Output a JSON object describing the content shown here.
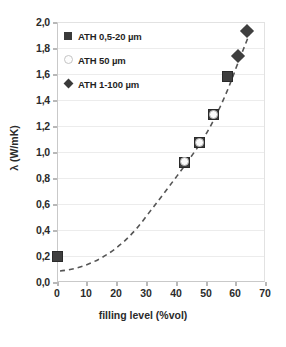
{
  "chart_data": {
    "type": "scatter",
    "title": "",
    "xlabel": "filling level (%vol)",
    "ylabel": "λ (W/mK)",
    "xlim": [
      0,
      70
    ],
    "ylim": [
      0.0,
      2.0
    ],
    "xticks": [
      "0",
      "10",
      "20",
      "30",
      "40",
      "50",
      "60",
      "70"
    ],
    "yticks": [
      "0,0",
      "0,2",
      "0,4",
      "0,6",
      "0,8",
      "1,0",
      "1,2",
      "1,4",
      "1,6",
      "1,8",
      "2,0"
    ],
    "grid": "horizontal",
    "legend_position": "upper-left-inside",
    "trendline": "dashed",
    "series": [
      {
        "name": "ATH 0,5-20 µm",
        "marker": "filled-square",
        "color": "#3f3f3f",
        "points": [
          {
            "x": 0,
            "y": 0.2
          },
          {
            "x": 43,
            "y": 0.92
          },
          {
            "x": 48,
            "y": 1.07
          },
          {
            "x": 52.5,
            "y": 1.29
          },
          {
            "x": 57.5,
            "y": 1.58
          }
        ]
      },
      {
        "name": "ATH 50 µm",
        "marker": "open-circle",
        "color": "#fbfbfb",
        "points": [
          {
            "x": 43,
            "y": 0.93
          },
          {
            "x": 48,
            "y": 1.07
          },
          {
            "x": 52.5,
            "y": 1.29
          }
        ]
      },
      {
        "name": "ATH 1-100 µm",
        "marker": "filled-diamond",
        "color": "#3f3f3f",
        "points": [
          {
            "x": 61,
            "y": 1.74
          },
          {
            "x": 64,
            "y": 1.93
          }
        ]
      }
    ]
  },
  "legend": {
    "items": [
      {
        "label": "ATH 0,5-20 µm",
        "marker": "filled-square"
      },
      {
        "label": "ATH 50 µm",
        "marker": "open-circle"
      },
      {
        "label": "ATH 1-100 µm",
        "marker": "filled-diamond"
      }
    ]
  },
  "axes": {
    "y_label": "λ (W/mK)",
    "x_label": "filling level (%vol)",
    "y_ticks": [
      "2,0",
      "1,8",
      "1,6",
      "1,4",
      "1,2",
      "1,0",
      "0,8",
      "0,6",
      "0,4",
      "0,2",
      "0,0"
    ],
    "x_ticks": [
      "0",
      "10",
      "20",
      "30",
      "40",
      "50",
      "60",
      "70"
    ]
  },
  "colors": {
    "marker_fill": "#3f3f3f",
    "open_marker_stroke": "#b5b5b5",
    "gridline": "#ececec",
    "axis": "#c9c9c9",
    "text": "#2b2b2b",
    "background": "#ffffff"
  }
}
